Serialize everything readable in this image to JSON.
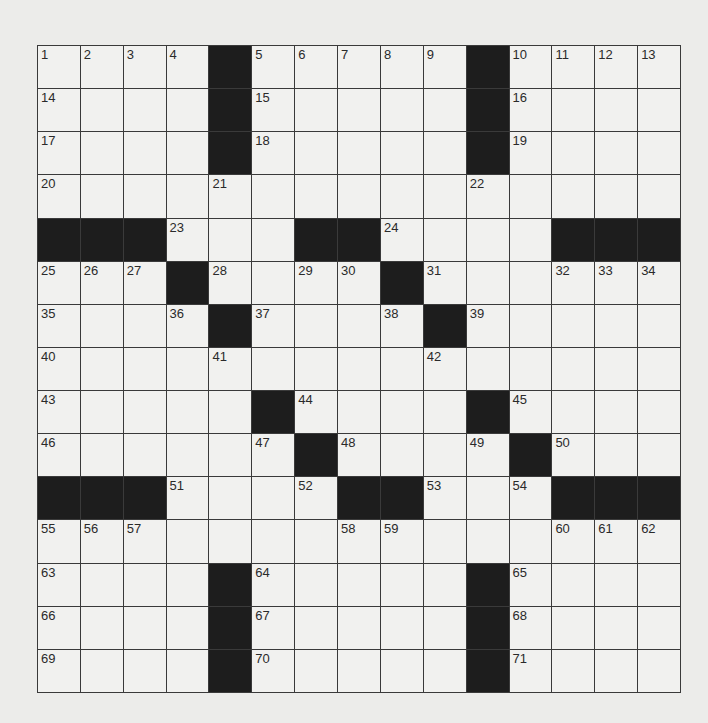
{
  "puzzle": {
    "rows": 15,
    "cols": 15,
    "colors": {
      "background": "#ececea",
      "cell": "#f1f1ef",
      "block": "#1d1d1d",
      "gridline": "#3a3a3a"
    },
    "grid": [
      "1 2 3 4 # 5 6 7 8 9 # 10 11 12 13",
      "14 . . . # 15 . . . . # 16 . . .",
      "17 . . . # 18 . . . . # 19 . . .",
      "20 . . . 21 . . . . . 22 . . . .",
      "# # # 23 . . # # 24 . . . # # #",
      "25 26 27 # 28 . 29 30 # 31 . . 32 33 34",
      "35 . . 36 # 37 . . 38 # 39 . . . .",
      "40 . . . 41 . . . . 42 . . . . .",
      "43 . . . . # 44 . . . # 45 . . .",
      "46 . . . . 47 # 48 . . 49 # 50 . .",
      "# # # 51 . . 52 # # 53 . 54 # # #",
      "55 56 57 . . . . 58 59 . . . 60 61 62",
      "63 . . . # 64 . . . . # 65 . . .",
      "66 . . . # 67 . . . . # 68 . . .",
      "69 . . . # 70 . . . . # 71 . . ."
    ]
  }
}
